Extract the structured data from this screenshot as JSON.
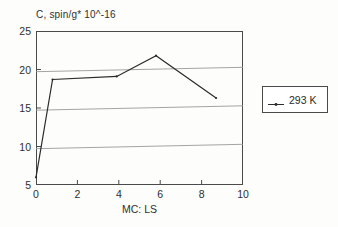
{
  "chart_data": {
    "type": "line",
    "title": "C, spin/g* 10^-16",
    "xlabel": "MC: LS",
    "ylabel": "C, spin/g* 10^-16",
    "xlim": [
      0,
      10
    ],
    "ylim": [
      5,
      25
    ],
    "xticks": [
      "0",
      "2",
      "4",
      "6",
      "8",
      "10"
    ],
    "xtick_values": [
      0,
      2,
      4,
      6,
      8,
      10
    ],
    "yticks": [
      "5",
      "10",
      "15",
      "20",
      "25"
    ],
    "ytick_values": [
      5,
      10,
      15,
      20,
      25
    ],
    "grid": "horizontal",
    "gridlines": [
      10,
      15,
      20
    ],
    "legend_position": "right-outside",
    "series": [
      {
        "name": "293 K",
        "x": [
          0,
          0.8,
          3.9,
          5.8,
          8.7
        ],
        "values": [
          6.0,
          18.7,
          19.1,
          21.8,
          16.3
        ]
      }
    ]
  },
  "legend": {
    "entries": [
      {
        "label": "293 K",
        "marker": "line-with-dot"
      }
    ]
  },
  "colors": {
    "line": "#2b2b2b",
    "frame": "#4a4a4a",
    "grid": "#9a9a9a",
    "background": "#fdfdfc"
  }
}
